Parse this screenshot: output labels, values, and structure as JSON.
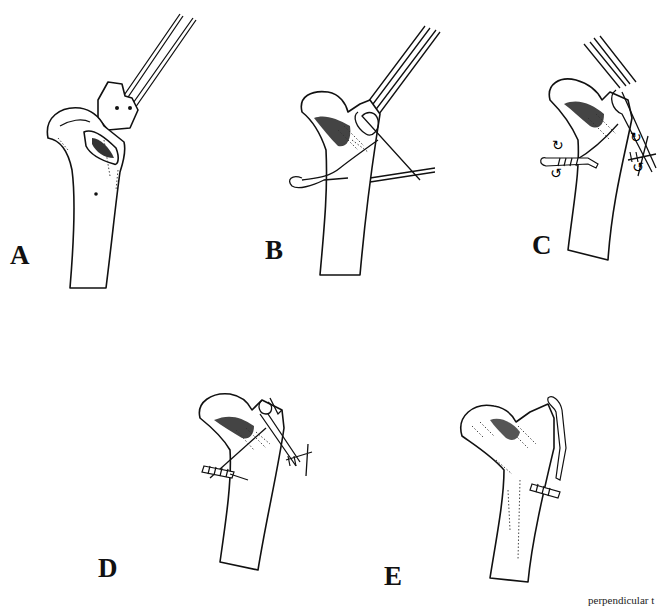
{
  "figure": {
    "panels": [
      {
        "id": "A",
        "label": "A",
        "description": "Proximal humerus with greater tuberosity fragment displaced; two K-wires inserted into fragment; cancellous bed exposed"
      },
      {
        "id": "B",
        "label": "B",
        "description": "Fragment reduced and held with K-wires; wire looped around K-wire tips and passed through drill hole in shaft"
      },
      {
        "id": "C",
        "label": "C",
        "description": "Figure-of-eight tension band wire tightened by twisting on both sides (rotation arrows)"
      },
      {
        "id": "D",
        "label": "D",
        "description": "Both twisted knots completed; K-wires bent over"
      },
      {
        "id": "E",
        "label": "E",
        "description": "Final construct: K-wire ends bent and impacted, wire twist cut short"
      }
    ],
    "caption_fragment": "perpendicular t"
  }
}
